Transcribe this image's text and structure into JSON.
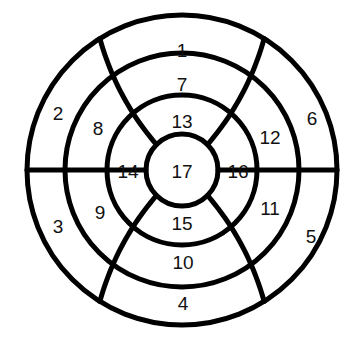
{
  "diagram": {
    "kind": "concentric-ring-puzzle",
    "background_color": "#ffffff",
    "stroke_color": "#000000",
    "label_color": "#111111",
    "center": {
      "x": 182,
      "y": 170
    },
    "radii": {
      "outer": 155,
      "ring2": 117,
      "ring3": 75,
      "inner": 36
    },
    "rings": [
      {
        "name": "outer-ring",
        "index": 1,
        "cell_count": 6,
        "cells": [
          {
            "id": "cell-1",
            "label": "1",
            "x": 182,
            "y": 50
          },
          {
            "id": "cell-2",
            "label": "2",
            "x": 58,
            "y": 113
          },
          {
            "id": "cell-3",
            "label": "3",
            "x": 58,
            "y": 226
          },
          {
            "id": "cell-4",
            "label": "4",
            "x": 183,
            "y": 303
          },
          {
            "id": "cell-5",
            "label": "5",
            "x": 311,
            "y": 236
          },
          {
            "id": "cell-6",
            "label": "6",
            "x": 312,
            "y": 118
          }
        ]
      },
      {
        "name": "second-ring",
        "index": 2,
        "cell_count": 6,
        "cells": [
          {
            "id": "cell-7",
            "label": "7",
            "x": 182,
            "y": 84
          },
          {
            "id": "cell-8",
            "label": "8",
            "x": 98,
            "y": 128
          },
          {
            "id": "cell-9",
            "label": "9",
            "x": 100,
            "y": 212
          },
          {
            "id": "cell-10",
            "label": "10",
            "x": 183,
            "y": 262
          },
          {
            "id": "cell-11",
            "label": "11",
            "x": 270,
            "y": 208
          },
          {
            "id": "cell-12",
            "label": "12",
            "x": 270,
            "y": 137
          }
        ]
      },
      {
        "name": "third-ring",
        "index": 3,
        "cell_count": 4,
        "cells": [
          {
            "id": "cell-13",
            "label": "13",
            "x": 182,
            "y": 121
          },
          {
            "id": "cell-14",
            "label": "14",
            "x": 128,
            "y": 171
          },
          {
            "id": "cell-15",
            "label": "15",
            "x": 182,
            "y": 223
          },
          {
            "id": "cell-16",
            "label": "16",
            "x": 238,
            "y": 171
          }
        ]
      },
      {
        "name": "center-disc",
        "index": 4,
        "cell_count": 1,
        "cells": [
          {
            "id": "cell-17",
            "label": "17",
            "x": 182,
            "y": 171
          }
        ]
      }
    ],
    "dividers": {
      "straight_radial": [
        {
          "id": "divider-west",
          "angle_deg": 180,
          "from_radius": 36,
          "to_radius": 155
        },
        {
          "id": "divider-east",
          "angle_deg": 0,
          "from_radius": 36,
          "to_radius": 155
        }
      ],
      "slanted_spiral": [
        {
          "id": "divider-nw",
          "outer_angle_deg": 122,
          "inner_angle_deg": 135
        },
        {
          "id": "divider-ne",
          "outer_angle_deg": 58,
          "inner_angle_deg": 45
        },
        {
          "id": "divider-sw",
          "outer_angle_deg": 238,
          "inner_angle_deg": 225
        },
        {
          "id": "divider-se",
          "outer_angle_deg": 302,
          "inner_angle_deg": 315
        }
      ]
    }
  }
}
